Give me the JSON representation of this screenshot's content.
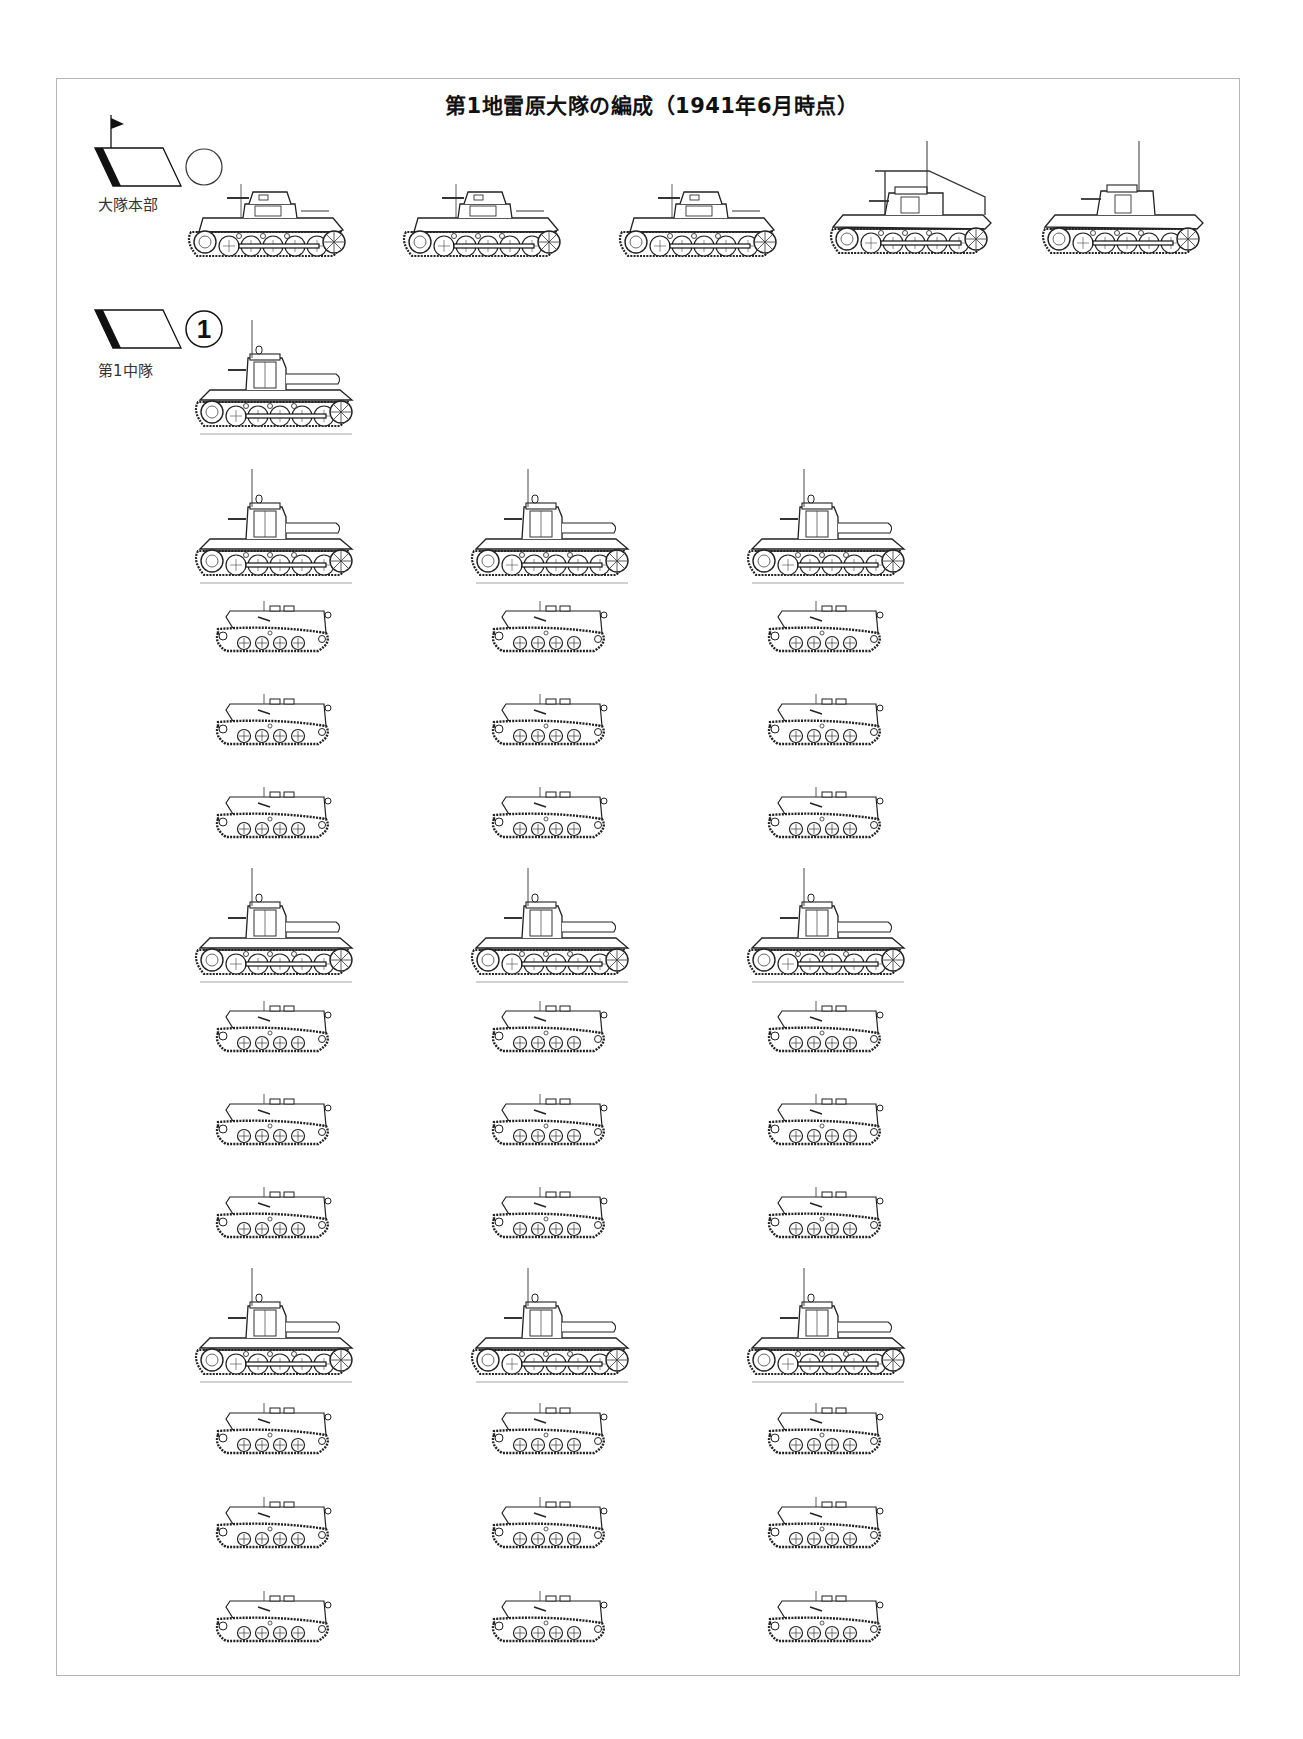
{
  "title": "第1地雷原大隊の編成（1941年6月時点）",
  "units": [
    {
      "id": "battalion-hq",
      "label": "大隊本部",
      "symbol": {
        "type": "armor-parallelogram",
        "flag": true,
        "marker": "circle-empty"
      },
      "vehicles": [
        {
          "type": "light-tank-turret"
        },
        {
          "type": "light-tank-turret"
        },
        {
          "type": "light-tank-turret"
        },
        {
          "type": "command-frame-antenna"
        },
        {
          "type": "command-tall-cab"
        }
      ]
    },
    {
      "id": "company-1",
      "label": "第1中隊",
      "symbol": {
        "type": "armor-parallelogram",
        "flag": false,
        "marker": "circle-number",
        "number": "1"
      },
      "hq_vehicles": [
        {
          "type": "minelayer-tall-cab"
        }
      ],
      "platoons": [
        {
          "columns": 3,
          "rows": [
            {
              "type": "minelayer-tall-cab"
            },
            {
              "type": "tracked-carrier"
            },
            {
              "type": "tracked-carrier"
            },
            {
              "type": "tracked-carrier"
            }
          ]
        },
        {
          "columns": 3,
          "rows": [
            {
              "type": "minelayer-tall-cab"
            },
            {
              "type": "tracked-carrier"
            },
            {
              "type": "tracked-carrier"
            },
            {
              "type": "tracked-carrier"
            }
          ]
        },
        {
          "columns": 3,
          "rows": [
            {
              "type": "minelayer-tall-cab"
            },
            {
              "type": "tracked-carrier"
            },
            {
              "type": "tracked-carrier"
            },
            {
              "type": "tracked-carrier"
            }
          ]
        }
      ]
    }
  ],
  "colors": {
    "line": "#222222",
    "frame": "#b5b5b5",
    "fill": "#ffffff"
  }
}
